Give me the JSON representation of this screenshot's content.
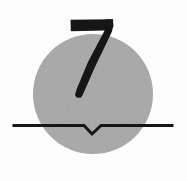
{
  "image": {
    "title": "Numeral seven over gray disc with notched baseline",
    "width": 187,
    "height": 181,
    "background_color": "#fefefe"
  },
  "elements": {
    "disc": {
      "name": "gray-circle",
      "shape": "circle",
      "center_x": 93,
      "center_y": 94,
      "radius": 60,
      "fill_color": "#a8a8a8",
      "texture": "fine-grain-noise"
    },
    "numeral": {
      "name": "numeral-seven",
      "character": "7",
      "fill_color": "#141414",
      "bbox_x": 70,
      "bbox_y": 19,
      "bbox_width": 43,
      "bbox_height": 79,
      "style": "bold-slab-serif-flat-top"
    },
    "baseline": {
      "name": "notched-baseline",
      "stroke_color": "#141414",
      "stroke_width": 3,
      "start_x": 14,
      "end_x": 172,
      "y": 125,
      "notch": {
        "label": "v-notch",
        "left_x": 84,
        "apex_x": 92,
        "right_x": 101,
        "apex_y": 134,
        "depth": 9
      }
    }
  },
  "palette": {
    "ink": "#141414",
    "disc_gray": "#a8a8a8",
    "paper": "#fefefe"
  }
}
